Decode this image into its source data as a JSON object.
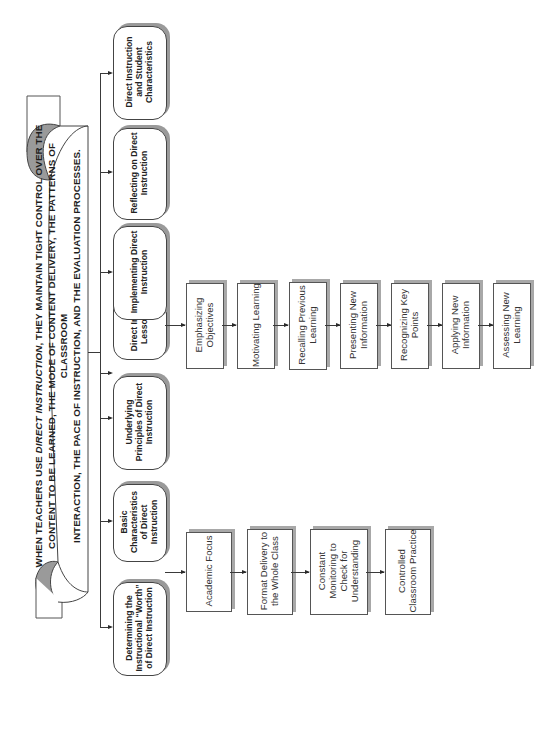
{
  "banner": {
    "line1_prefix": "WHEN TEACHERS USE ",
    "line1_italic": "DIRECT INSTRUCTION",
    "line1_suffix": ", THEY MAINTAIN TIGHT CONTROL OVER THE",
    "line2": "CONTENT TO BE LEARNED, THE MODE OF CONTENT DELIVERY, THE PATTERNS OF CLASSROOM",
    "line3": "INTERACTION, THE PACE OF INSTRUCTION, AND THE EVALUATION PROCESSES."
  },
  "main_topics": [
    {
      "label": "Determining the Instructional “Worth” of Direct Instruction"
    },
    {
      "label": "Basic Characteristics of Direct Instruction"
    },
    {
      "label": "Underlying Principles of Direct Instruction"
    },
    {
      "label": "Direct Instruction - Lesson Models"
    },
    {
      "label": "Implementing Direct Instruction"
    },
    {
      "label": "Reflecting on Direct Instruction"
    },
    {
      "label": "Direct Instruction and Student Characteristics"
    }
  ],
  "basic_characteristics": [
    {
      "label": "Academic Focus"
    },
    {
      "label": "Format Delivery to the Whole Class"
    },
    {
      "label": "Constant Monitoring to Check for Understanding"
    },
    {
      "label": "Controlled Classroom Practice"
    }
  ],
  "lesson_model_steps": [
    {
      "label": "Emphasizing Objectives"
    },
    {
      "label": "Motivating Learning"
    },
    {
      "label": "Recalling Previous Learning"
    },
    {
      "label": "Presenting New Information"
    },
    {
      "label": "Recognizing Key Points"
    },
    {
      "label": "Applying New Information"
    },
    {
      "label": "Assessing New Learning"
    }
  ]
}
